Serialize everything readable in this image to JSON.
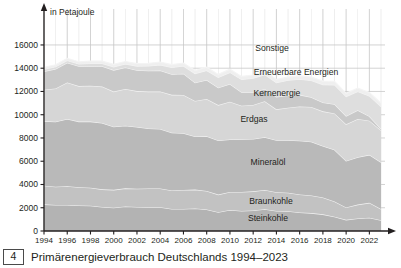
{
  "figure": {
    "number": "4",
    "caption": "Primärenergieverbrauch Deutschlands 1994–2023"
  },
  "axis": {
    "unit_label": "in Petajoule",
    "y_ticks": [
      "0",
      "2000",
      "4000",
      "6000",
      "8000",
      "10000",
      "12000",
      "14000",
      "16000"
    ],
    "x_ticks": [
      "1994",
      "1996",
      "1998",
      "2000",
      "2002",
      "2004",
      "2006",
      "2008",
      "2010",
      "2012",
      "2014",
      "2016",
      "2018",
      "2020",
      "2022"
    ],
    "y_min": 0,
    "y_max": 17200,
    "x_min": 1994,
    "x_max": 2023
  },
  "series_labels": {
    "sonstige": "Sonstige",
    "erneuerbare": "Erneuerbare Energien",
    "kernenergie": "Kernenergie",
    "erdgas": "Erdgas",
    "mineraloel": "Mineralöl",
    "braunkohle": "Braunkohle",
    "steinkohle": "Steinkohle"
  },
  "colors": {
    "steinkohle": "#b3b3b3",
    "braunkohle": "#c2c2c2",
    "mineraloel": "#b9b9b9",
    "erdgas": "#d6d6d6",
    "kernenergie": "#c9c9c9",
    "erneuerbare": "#dedede",
    "sonstige": "#efefef",
    "grid": "#c8c8c8",
    "axis": "#231f20",
    "separator": "#f4f4f4"
  },
  "chart_data": {
    "type": "area",
    "title": "Primärenergieverbrauch Deutschlands 1994–2023",
    "xlabel": "",
    "ylabel": "in Petajoule",
    "ylim": [
      0,
      17200
    ],
    "grid": true,
    "legend": "inline-labels",
    "stacked": true,
    "x": [
      1994,
      1995,
      1996,
      1997,
      1998,
      1999,
      2000,
      2001,
      2002,
      2003,
      2004,
      2005,
      2006,
      2007,
      2008,
      2009,
      2010,
      2011,
      2012,
      2013,
      2014,
      2015,
      2016,
      2017,
      2018,
      2019,
      2020,
      2021,
      2022,
      2023
    ],
    "series": [
      {
        "name": "Steinkohle",
        "values": [
          2290,
          2230,
          2240,
          2200,
          2170,
          2070,
          2010,
          2110,
          2060,
          2050,
          2050,
          1890,
          1900,
          1930,
          1850,
          1620,
          1800,
          1730,
          1770,
          1870,
          1730,
          1700,
          1600,
          1540,
          1430,
          1220,
          960,
          1080,
          1140,
          920
        ]
      },
      {
        "name": "Braunkohle",
        "values": [
          1600,
          1570,
          1610,
          1560,
          1550,
          1510,
          1530,
          1560,
          1580,
          1600,
          1610,
          1600,
          1630,
          1630,
          1590,
          1510,
          1560,
          1620,
          1640,
          1650,
          1610,
          1590,
          1540,
          1510,
          1450,
          1310,
          1070,
          1190,
          1280,
          980
        ]
      },
      {
        "name": "Mineralöl",
        "values": [
          5560,
          5600,
          5780,
          5650,
          5690,
          5710,
          5420,
          5380,
          5300,
          5170,
          5110,
          4970,
          4880,
          4570,
          4710,
          4650,
          4510,
          4540,
          4500,
          4550,
          4470,
          4520,
          4620,
          4620,
          4430,
          4450,
          3990,
          4070,
          4130,
          4010
        ]
      },
      {
        "name": "Erdgas",
        "values": [
          2700,
          2850,
          3150,
          3050,
          3080,
          3130,
          3030,
          3160,
          3090,
          3170,
          3230,
          3250,
          3290,
          3060,
          3210,
          3050,
          3240,
          2890,
          2930,
          3090,
          2650,
          2790,
          2950,
          3000,
          2980,
          3130,
          3150,
          3300,
          2940,
          2750
        ]
      },
      {
        "name": "Kernenergie",
        "values": [
          1580,
          1680,
          1690,
          1710,
          1700,
          1750,
          1850,
          1850,
          1800,
          1800,
          1810,
          1780,
          1830,
          1560,
          1620,
          1500,
          1530,
          1150,
          1100,
          1060,
          1060,
          1050,
          1000,
          830,
          760,
          800,
          710,
          740,
          370,
          130
        ]
      },
      {
        "name": "Erneuerbare Energien",
        "values": [
          180,
          190,
          190,
          200,
          220,
          240,
          280,
          300,
          350,
          410,
          480,
          570,
          660,
          790,
          830,
          880,
          1000,
          1100,
          1200,
          1230,
          1240,
          1310,
          1340,
          1440,
          1540,
          1660,
          1680,
          1620,
          1760,
          1900
        ]
      },
      {
        "name": "Sonstige",
        "values": [
          170,
          180,
          190,
          190,
          200,
          200,
          210,
          210,
          220,
          230,
          240,
          250,
          260,
          270,
          280,
          260,
          280,
          270,
          280,
          290,
          280,
          280,
          290,
          300,
          300,
          300,
          280,
          290,
          300,
          300
        ]
      }
    ]
  }
}
